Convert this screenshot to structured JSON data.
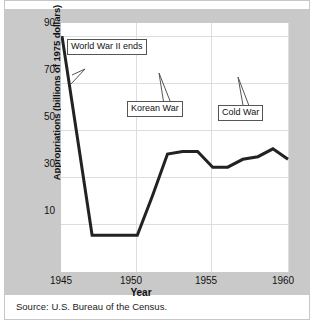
{
  "figure": {
    "source_note": "Source: U.S. Bureau of the Census."
  },
  "chart_data": {
    "type": "line",
    "title": "",
    "xlabel": "Year",
    "ylabel": "Appropriations (billions of 1975 dollars)",
    "xlim": [
      1945,
      1960
    ],
    "ylim": [
      0,
      95
    ],
    "xticks": [
      1945,
      1950,
      1955,
      1960
    ],
    "xtick_labels": [
      "1945",
      "1950",
      "1955",
      "1960"
    ],
    "yticks": [
      10,
      30,
      50,
      70,
      90
    ],
    "ytick_labels": [
      "10",
      "30",
      "50",
      "70",
      "90"
    ],
    "grid": true,
    "legend": "none",
    "line_color": "#222222",
    "line_width": 3,
    "x": [
      1945,
      1946,
      1947,
      1948,
      1949,
      1950,
      1951,
      1952,
      1953,
      1954,
      1955,
      1956,
      1957,
      1958,
      1959,
      1960
    ],
    "values": [
      90,
      52,
      14,
      14,
      14,
      14,
      29,
      45,
      46,
      46,
      40,
      40,
      43,
      44,
      47,
      43
    ],
    "series": [
      {
        "name": "Appropriations",
        "values": [
          90,
          52,
          14,
          14,
          14,
          14,
          29,
          45,
          46,
          46,
          40,
          40,
          43,
          44,
          47,
          43
        ]
      }
    ],
    "annotations": [
      {
        "id": "world-war-ii-ends",
        "label": "World War II ends",
        "box_x": 62,
        "box_y": 23,
        "point_x": 32,
        "point_y": 54
      },
      {
        "id": "korean-war",
        "label": "Korean War",
        "box_x": 66,
        "box_y": 78,
        "point_x": 123,
        "point_y": 115
      },
      {
        "id": "cold-war",
        "label": "Cold War",
        "box_x": 157,
        "box_y": 82,
        "point_x": 203,
        "point_y": 114
      }
    ]
  }
}
